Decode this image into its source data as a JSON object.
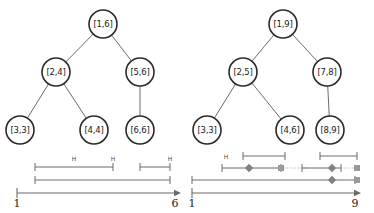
{
  "figure": {
    "title": "",
    "panels": [
      {
        "id": "left",
        "tree": {
          "nodes": [
            {
              "id": "L0",
              "label": "[1,6]",
              "cx": 103,
              "cy": 24,
              "r": 14
            },
            {
              "id": "L1",
              "label": "[2,4]",
              "cx": 56,
              "cy": 72,
              "r": 14
            },
            {
              "id": "L2",
              "label": "[5,6]",
              "cx": 140,
              "cy": 72,
              "r": 14
            },
            {
              "id": "L3",
              "label": "[3,3]",
              "cx": 20,
              "cy": 130,
              "r": 14
            },
            {
              "id": "L4",
              "label": "[4,4]",
              "cx": 94,
              "cy": 130,
              "r": 14
            },
            {
              "id": "L5",
              "label": "[6,6]",
              "cx": 140,
              "cy": 130,
              "r": 14
            }
          ],
          "edges": [
            {
              "from": "L0",
              "to": "L1"
            },
            {
              "from": "L0",
              "to": "L2"
            },
            {
              "from": "L1",
              "to": "L3"
            },
            {
              "from": "L1",
              "to": "L4"
            },
            {
              "from": "L2",
              "to": "L5"
            }
          ]
        },
        "axis": {
          "start_label": "1",
          "end_label": "6",
          "x_start": 17,
          "x_end": 175,
          "y": 193,
          "tick_label_y": 207
        },
        "intervals": [
          {
            "x1": 35,
            "x2": 170,
            "y": 180,
            "left_cap": true,
            "right_cap": true,
            "dotted": false
          },
          {
            "x1": 35,
            "x2": 113,
            "y": 167,
            "left_cap": true,
            "right_cap": true,
            "dotted": false
          },
          {
            "x1": 140,
            "x2": 170,
            "y": 167,
            "left_cap": true,
            "right_cap": true,
            "dotted": false
          }
        ],
        "h_marks": [
          {
            "x": 74,
            "y": 161,
            "text": "H"
          },
          {
            "x": 113,
            "y": 161,
            "text": "H"
          },
          {
            "x": 170,
            "y": 161,
            "text": "H"
          }
        ],
        "diamonds": [],
        "squares": []
      },
      {
        "id": "right",
        "tree": {
          "nodes": [
            {
              "id": "R0",
              "label": "[1,9]",
              "cx": 283,
              "cy": 24,
              "r": 14
            },
            {
              "id": "R1",
              "label": "[2,5]",
              "cx": 243,
              "cy": 72,
              "r": 14
            },
            {
              "id": "R2",
              "label": "[7,8]",
              "cx": 327,
              "cy": 72,
              "r": 14
            },
            {
              "id": "R3",
              "label": "[3,3]",
              "cx": 207,
              "cy": 130,
              "r": 14
            },
            {
              "id": "R4",
              "label": "[4,6]",
              "cx": 290,
              "cy": 130,
              "r": 14
            },
            {
              "id": "R5",
              "label": "[8,9]",
              "cx": 330,
              "cy": 130,
              "r": 14
            }
          ],
          "edges": [
            {
              "from": "R0",
              "to": "R1"
            },
            {
              "from": "R0",
              "to": "R2"
            },
            {
              "from": "R1",
              "to": "R3"
            },
            {
              "from": "R1",
              "to": "R4"
            },
            {
              "from": "R2",
              "to": "R5"
            }
          ]
        },
        "axis": {
          "start_label": "1",
          "end_label": "9",
          "x_start": 192,
          "x_end": 355,
          "y": 193,
          "tick_label_y": 207
        },
        "intervals": [
          {
            "x1": 192,
            "x2": 355,
            "y": 180,
            "left_cap": true,
            "right_cap": true,
            "dotted": false
          },
          {
            "x1": 222,
            "x2": 281,
            "y": 168,
            "left_cap": true,
            "right_cap": true,
            "dotted": false
          },
          {
            "x1": 281,
            "x2": 308,
            "y": 168,
            "left_cap": false,
            "right_cap": false,
            "dotted": true
          },
          {
            "x1": 302,
            "x2": 341,
            "y": 168,
            "left_cap": true,
            "right_cap": true,
            "dotted": false
          },
          {
            "x1": 341,
            "x2": 357,
            "y": 168,
            "left_cap": false,
            "right_cap": false,
            "dotted": true
          },
          {
            "x1": 243,
            "x2": 285,
            "y": 156,
            "left_cap": true,
            "right_cap": true,
            "dotted": false
          },
          {
            "x1": 320,
            "x2": 357,
            "y": 156,
            "left_cap": true,
            "right_cap": true,
            "dotted": false
          }
        ],
        "h_marks": [
          {
            "x": 226,
            "y": 159,
            "text": "H"
          }
        ],
        "diamonds": [
          {
            "x": 249,
            "y": 168
          },
          {
            "x": 332,
            "y": 168
          },
          {
            "x": 332,
            "y": 180
          }
        ],
        "squares": [
          {
            "x": 281,
            "y": 168
          },
          {
            "x": 357,
            "y": 168
          },
          {
            "x": 357,
            "y": 180
          }
        ]
      }
    ]
  },
  "chart_data": {
    "type": "diagram",
    "subtitle": "",
    "xlabel": "",
    "ylabel": "",
    "panels": [
      {
        "name": "left-panel",
        "tree_labels": [
          "[1,6]",
          "[2,4]",
          "[5,6]",
          "[3,3]",
          "[4,4]",
          "[6,6]"
        ],
        "root": "[1,6]",
        "axis_range": [
          1,
          6
        ],
        "axis_tick_labels": [
          "1",
          "6"
        ],
        "interval_count": 3,
        "marker_count": 0
      },
      {
        "name": "right-panel",
        "tree_labels": [
          "[1,9]",
          "[2,5]",
          "[7,8]",
          "[3,3]",
          "[4,6]",
          "[8,9]"
        ],
        "root": "[1,9]",
        "axis_range": [
          1,
          9
        ],
        "axis_tick_labels": [
          "1",
          "9"
        ],
        "interval_count": 7,
        "marker_count": 6
      }
    ],
    "colors": {
      "node_stroke": "#2a2a2a",
      "node_fill": "#ffffff",
      "edge": "#5a5a5a",
      "axis": "#6b6b6b",
      "diamond": "#808080",
      "square": "#9a9a9a",
      "dotted": "#b4b4b4"
    }
  }
}
